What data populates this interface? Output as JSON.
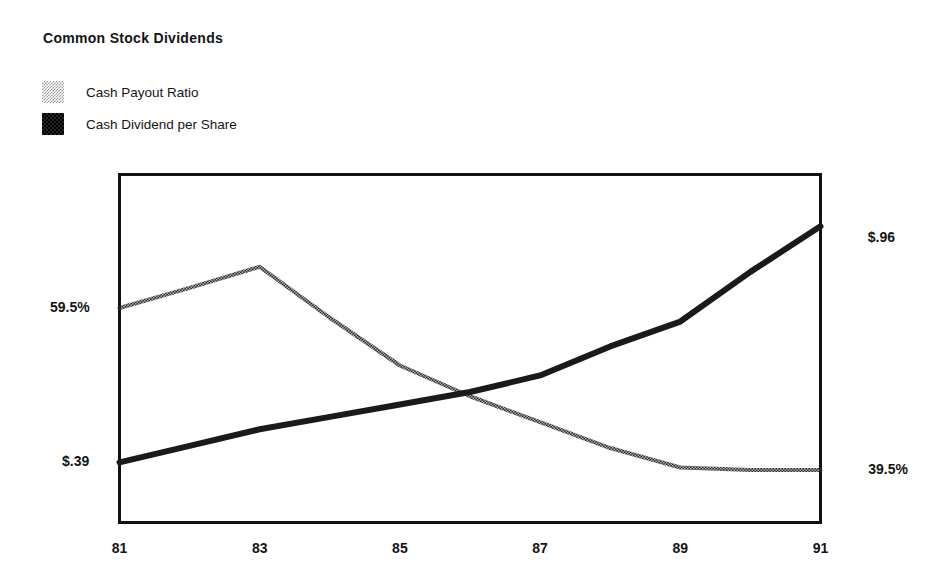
{
  "chart_data": {
    "type": "line",
    "title": "Common Stock Dividends",
    "xlabel": "",
    "ylabel": "",
    "grid": false,
    "legend_position": "top-left",
    "categories": [
      "81",
      "82",
      "83",
      "84",
      "85",
      "86",
      "87",
      "88",
      "89",
      "90",
      "91"
    ],
    "x_tick_labels": [
      "81",
      "83",
      "85",
      "87",
      "89",
      "91"
    ],
    "x_tick_values": [
      81,
      83,
      85,
      87,
      89,
      91
    ],
    "xlim": [
      81,
      91
    ],
    "series": [
      {
        "name": "Cash Payout Ratio",
        "style": "dotted",
        "axis": "left-percent",
        "unit": "%",
        "x": [
          81,
          82,
          83,
          84,
          85,
          86,
          87,
          88,
          89,
          90,
          91
        ],
        "values": [
          59.5,
          62.0,
          64.6,
          58.3,
          52.4,
          48.6,
          45.4,
          42.2,
          39.8,
          39.5,
          39.5
        ],
        "start_label": "59.5%",
        "end_label": "39.5%"
      },
      {
        "name": "Cash Dividend per Share",
        "style": "solid",
        "axis": "right-dollar",
        "unit": "$",
        "x": [
          81,
          82,
          83,
          84,
          85,
          86,
          87,
          88,
          89,
          90,
          91
        ],
        "values": [
          0.39,
          0.43,
          0.47,
          0.5,
          0.53,
          0.56,
          0.6,
          0.67,
          0.73,
          0.85,
          0.96
        ],
        "start_label": "$.39",
        "end_label": "$.96"
      }
    ],
    "annotations": [
      {
        "text": "59.5%",
        "position": "left",
        "series": "Cash Payout Ratio"
      },
      {
        "text": "$.39",
        "position": "left",
        "series": "Cash Dividend per Share"
      },
      {
        "text": "$.96",
        "position": "right",
        "series": "Cash Dividend per Share"
      },
      {
        "text": "39.5%",
        "position": "right",
        "series": "Cash Payout Ratio"
      }
    ]
  },
  "legend": {
    "items": [
      {
        "label": "Cash Payout Ratio",
        "swatch": "dotted-swatch-icon"
      },
      {
        "label": "Cash Dividend per Share",
        "swatch": "solid-swatch-icon"
      }
    ]
  },
  "labels": {
    "left_top": "59.5%",
    "left_bottom": "$.39",
    "right_top": "$.96",
    "right_bottom": "39.5%"
  },
  "x_axis": {
    "ticks": [
      "81",
      "83",
      "85",
      "87",
      "89",
      "91"
    ]
  },
  "colors": {
    "line_solid": "#1a1a1a",
    "line_dotted": "#6e6e6e",
    "frame": "#111111",
    "background": "#ffffff",
    "text": "#141414"
  }
}
